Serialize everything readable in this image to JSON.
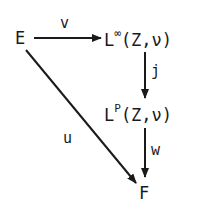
{
  "diagram": {
    "type": "commutative-diagram",
    "nodes": {
      "E": {
        "base": "E"
      },
      "Linf": {
        "base": "L",
        "sup": "∞",
        "args": "(Z,ν)"
      },
      "Lp": {
        "base": "L",
        "sup": "P",
        "args": "(Z,ν)"
      },
      "F": {
        "base": "F"
      }
    },
    "edges": {
      "v": {
        "label": "v",
        "from": "E",
        "to": "L∞(Z,ν)"
      },
      "j": {
        "label": "j",
        "from": "L∞(Z,ν)",
        "to": "LP(Z,ν)"
      },
      "w": {
        "label": "w",
        "from": "LP(Z,ν)",
        "to": "F"
      },
      "u": {
        "label": "u",
        "from": "E",
        "to": "F"
      }
    },
    "colors": {
      "ink": "#1a1a1a",
      "background": "#ffffff"
    }
  }
}
